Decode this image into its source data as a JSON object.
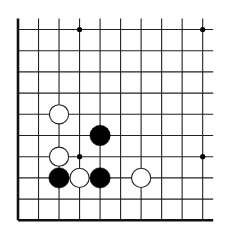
{
  "board": {
    "columns": 10,
    "rows": 10,
    "origin_x": 18,
    "origin_y": 29.5,
    "spacing_x": 20.52,
    "spacing_y": 21.2,
    "extend_top": 11,
    "extend_right": 10.5,
    "line_color": "#222222",
    "edge_color": "#111111",
    "open_edges": [
      "top",
      "right"
    ],
    "thick_edges": [
      "left",
      "bottom"
    ]
  },
  "star_points": [
    {
      "col": 3,
      "row": 0
    },
    {
      "col": 9,
      "row": 0
    },
    {
      "col": 3,
      "row": 6
    },
    {
      "col": 9,
      "row": 6
    }
  ],
  "stones": [
    {
      "color": "white",
      "col": 2,
      "row": 4
    },
    {
      "color": "black",
      "col": 4,
      "row": 5
    },
    {
      "color": "white",
      "col": 2,
      "row": 6
    },
    {
      "color": "black",
      "col": 2,
      "row": 7
    },
    {
      "color": "white",
      "col": 3,
      "row": 7
    },
    {
      "color": "black",
      "col": 4,
      "row": 7
    },
    {
      "color": "white",
      "col": 6,
      "row": 7
    }
  ],
  "colors": {
    "black_stone": "#000000",
    "white_stone": "#ffffff",
    "white_stone_outline": "#222222",
    "star_point": "#000000"
  }
}
